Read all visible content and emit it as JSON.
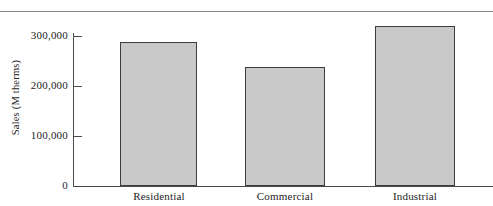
{
  "chart_data": {
    "type": "bar",
    "title": "",
    "xlabel": "",
    "ylabel": "Sales (M therms)",
    "categories": [
      "Residential",
      "Commercial",
      "Industrial"
    ],
    "values": [
      289000,
      238000,
      320000
    ],
    "ylim": [
      0,
      330000
    ],
    "yticks": [
      0,
      100000,
      200000,
      300000
    ],
    "ytick_labels": [
      "0",
      "100,000",
      "200,000",
      "300,000"
    ],
    "grid": false,
    "legend": null,
    "bar_fill_color": "#c9c9c9",
    "bar_edge_color": "#3d3d3d",
    "axis_color": "#4a4a4a",
    "text_color": "#1c1c1c",
    "background_color": "#ffffff"
  },
  "figure": {
    "top_rule_color": "#8a8a8a"
  }
}
